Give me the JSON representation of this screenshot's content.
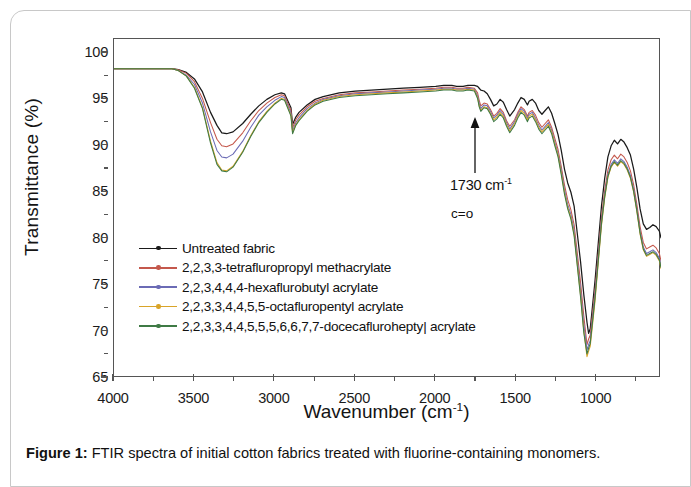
{
  "figure": {
    "caption_label": "Figure 1:",
    "caption_text": " FTIR spectra of initial cotton fabrics treated with fluorine-containing monomers."
  },
  "annotation": {
    "wavenumber": "1730 cm",
    "wavenumber_sup": "-1",
    "assignment": "c=o"
  },
  "chart_data": {
    "type": "line",
    "title": "",
    "xlabel": "Wavenumber (cm",
    "xlabel_sup": "-1",
    "xlabel_tail": ")",
    "ylabel": "Transmittance (%)",
    "xlim": [
      4000,
      600
    ],
    "ylim": [
      65,
      101.5
    ],
    "x_reversed": true,
    "grid": false,
    "legend_position": "center-left",
    "xticks": [
      4000,
      3500,
      3000,
      2500,
      2000,
      1500,
      1000
    ],
    "xtick_labels": [
      "4000",
      "3500",
      "3000",
      "2500",
      "2000",
      "1500",
      "1000"
    ],
    "x_minor_ticks": [
      3750,
      3250,
      2750,
      2250,
      1750,
      1250,
      750
    ],
    "yticks": [
      65,
      70,
      75,
      80,
      85,
      90,
      95,
      100
    ],
    "ytick_labels": [
      "65",
      "70",
      "75",
      "80",
      "85",
      "90",
      "95",
      "100"
    ],
    "y_minor_ticks": [
      67.5,
      72.5,
      77.5,
      82.5,
      87.5,
      92.5,
      97.5
    ],
    "series": [
      {
        "name": "Untreated fabric",
        "color": "#1a1a1a",
        "marker": "dot",
        "x": [
          4000,
          3900,
          3800,
          3700,
          3640,
          3600,
          3550,
          3500,
          3450,
          3400,
          3360,
          3330,
          3300,
          3260,
          3200,
          3150,
          3100,
          3050,
          3000,
          2960,
          2940,
          2900,
          2890,
          2870,
          2850,
          2800,
          2750,
          2700,
          2600,
          2500,
          2400,
          2300,
          2200,
          2100,
          2000,
          1950,
          1900,
          1870,
          1830,
          1800,
          1760,
          1740,
          1730,
          1720,
          1700,
          1680,
          1660,
          1640,
          1620,
          1600,
          1580,
          1560,
          1540,
          1510,
          1490,
          1470,
          1450,
          1430,
          1420,
          1400,
          1380,
          1360,
          1340,
          1320,
          1300,
          1280,
          1260,
          1240,
          1220,
          1200,
          1180,
          1160,
          1140,
          1120,
          1100,
          1080,
          1060,
          1050,
          1040,
          1030,
          1010,
          990,
          970,
          950,
          930,
          910,
          890,
          870,
          850,
          830,
          810,
          790,
          770,
          750,
          730,
          710,
          690,
          670,
          650,
          630,
          610,
          600
        ],
        "y": [
          98.3,
          98.3,
          98.3,
          98.3,
          98.3,
          98.2,
          97.9,
          97.2,
          95.8,
          93.6,
          92.2,
          91.4,
          91.3,
          91.5,
          92.4,
          93.4,
          94.3,
          95.0,
          95.5,
          95.7,
          95.6,
          94.1,
          92.3,
          93.1,
          93.6,
          94.4,
          95.0,
          95.3,
          95.7,
          95.9,
          96.0,
          96.1,
          96.2,
          96.3,
          96.4,
          96.5,
          96.5,
          96.4,
          96.4,
          96.5,
          96.5,
          96.4,
          96.2,
          96.0,
          95.9,
          95.6,
          95.0,
          94.3,
          94.5,
          95.0,
          94.7,
          93.9,
          93.2,
          93.9,
          94.6,
          95.2,
          95.0,
          94.4,
          94.8,
          95.0,
          94.6,
          93.8,
          93.4,
          93.8,
          94.2,
          93.5,
          92.4,
          91.2,
          89.5,
          87.5,
          86.0,
          85.0,
          83.5,
          80.5,
          77.5,
          74.0,
          71.0,
          69.8,
          70.3,
          72.0,
          75.5,
          79.5,
          83.5,
          86.5,
          88.8,
          90.0,
          90.6,
          90.2,
          90.7,
          90.4,
          89.8,
          89.0,
          87.5,
          85.5,
          83.2,
          81.6,
          81.0,
          81.2,
          81.5,
          81.3,
          80.8,
          80.1
        ],
        "linewidth": 1.25
      },
      {
        "name": "2,2,3,3-tetrafluropropyl methacrylate",
        "color": "#c4584c",
        "marker": "dot",
        "x": [
          4000,
          3900,
          3800,
          3700,
          3640,
          3600,
          3550,
          3500,
          3450,
          3400,
          3360,
          3330,
          3300,
          3260,
          3200,
          3150,
          3100,
          3050,
          3000,
          2960,
          2940,
          2900,
          2890,
          2870,
          2850,
          2800,
          2750,
          2700,
          2600,
          2500,
          2400,
          2300,
          2200,
          2100,
          2000,
          1950,
          1900,
          1870,
          1830,
          1800,
          1760,
          1740,
          1730,
          1720,
          1700,
          1680,
          1660,
          1640,
          1620,
          1600,
          1580,
          1560,
          1540,
          1510,
          1490,
          1470,
          1450,
          1430,
          1420,
          1400,
          1380,
          1360,
          1340,
          1320,
          1300,
          1280,
          1260,
          1240,
          1220,
          1200,
          1180,
          1160,
          1140,
          1120,
          1100,
          1080,
          1060,
          1050,
          1040,
          1030,
          1010,
          990,
          970,
          950,
          930,
          910,
          890,
          870,
          850,
          830,
          810,
          790,
          770,
          750,
          730,
          710,
          690,
          670,
          650,
          630,
          610,
          600
        ],
        "y": [
          98.3,
          98.3,
          98.3,
          98.3,
          98.3,
          98.2,
          97.8,
          96.9,
          95.1,
          92.5,
          90.7,
          90.0,
          89.9,
          90.2,
          91.4,
          92.7,
          93.8,
          94.6,
          95.2,
          95.5,
          95.4,
          93.8,
          91.9,
          92.8,
          93.3,
          94.2,
          94.8,
          95.1,
          95.5,
          95.7,
          95.8,
          95.9,
          96.0,
          96.1,
          96.2,
          96.3,
          96.3,
          96.2,
          96.2,
          96.3,
          96.2,
          95.7,
          94.9,
          94.3,
          94.6,
          94.5,
          93.9,
          93.2,
          93.5,
          94.0,
          93.6,
          92.7,
          92.1,
          92.8,
          93.6,
          94.2,
          93.9,
          93.2,
          93.6,
          93.8,
          93.3,
          92.5,
          92.0,
          92.4,
          92.8,
          92.0,
          90.8,
          89.6,
          87.8,
          85.8,
          84.2,
          83.1,
          81.5,
          78.4,
          75.3,
          71.7,
          68.6,
          69.2,
          69.6,
          71.2,
          74.5,
          78.4,
          82.3,
          85.2,
          87.4,
          88.5,
          89.0,
          88.6,
          89.1,
          88.8,
          88.2,
          87.3,
          85.8,
          83.7,
          81.3,
          79.6,
          78.9,
          79.1,
          79.3,
          79.0,
          78.4,
          77.6
        ],
        "linewidth": 1.05
      },
      {
        "name": "2,2,3,4,4,4-hexaflurobutyl acrylate",
        "color": "#6b6bb5",
        "marker": "dot",
        "x": [
          4000,
          3900,
          3800,
          3700,
          3640,
          3600,
          3550,
          3500,
          3450,
          3400,
          3360,
          3330,
          3300,
          3260,
          3200,
          3150,
          3100,
          3050,
          3000,
          2960,
          2940,
          2900,
          2890,
          2870,
          2850,
          2800,
          2750,
          2700,
          2600,
          2500,
          2400,
          2300,
          2200,
          2100,
          2000,
          1950,
          1900,
          1870,
          1830,
          1800,
          1760,
          1740,
          1730,
          1720,
          1700,
          1680,
          1660,
          1640,
          1620,
          1600,
          1580,
          1560,
          1540,
          1510,
          1490,
          1470,
          1450,
          1430,
          1420,
          1400,
          1380,
          1360,
          1340,
          1320,
          1300,
          1280,
          1260,
          1240,
          1220,
          1200,
          1180,
          1160,
          1140,
          1120,
          1100,
          1080,
          1060,
          1050,
          1040,
          1030,
          1010,
          990,
          970,
          950,
          930,
          910,
          890,
          870,
          850,
          830,
          810,
          790,
          770,
          750,
          730,
          710,
          690,
          670,
          650,
          630,
          610,
          600
        ],
        "y": [
          98.3,
          98.3,
          98.3,
          98.3,
          98.3,
          98.1,
          97.6,
          96.6,
          94.6,
          91.5,
          89.5,
          88.8,
          88.7,
          89.1,
          90.5,
          92.0,
          93.3,
          94.2,
          94.9,
          95.3,
          95.2,
          93.5,
          91.6,
          92.5,
          93.0,
          94.0,
          94.6,
          95.0,
          95.4,
          95.6,
          95.7,
          95.8,
          95.9,
          96.0,
          96.1,
          96.2,
          96.2,
          96.1,
          96.1,
          96.2,
          96.1,
          95.4,
          94.6,
          94.0,
          94.4,
          94.3,
          93.7,
          93.0,
          93.3,
          93.8,
          93.4,
          92.5,
          91.8,
          92.6,
          93.4,
          94.0,
          93.7,
          93.0,
          93.4,
          93.6,
          93.0,
          92.2,
          91.7,
          92.1,
          92.5,
          91.7,
          90.4,
          89.2,
          87.4,
          85.3,
          83.7,
          82.6,
          80.9,
          77.7,
          74.5,
          70.8,
          68.0,
          68.6,
          69.0,
          70.6,
          73.9,
          77.9,
          81.8,
          84.7,
          86.9,
          88.0,
          88.5,
          88.1,
          88.6,
          88.3,
          87.7,
          86.8,
          85.3,
          83.2,
          80.8,
          79.1,
          78.4,
          78.6,
          78.8,
          78.5,
          77.9,
          77.1
        ],
        "linewidth": 1.05
      },
      {
        "name": "2,2,3,3,4,4,5,5-octafluropentyl acrylate",
        "color": "#d9a428",
        "marker": "dot",
        "x": [
          4000,
          3900,
          3800,
          3700,
          3640,
          3600,
          3550,
          3500,
          3450,
          3400,
          3360,
          3330,
          3300,
          3260,
          3200,
          3150,
          3100,
          3050,
          3000,
          2960,
          2940,
          2900,
          2890,
          2870,
          2850,
          2800,
          2750,
          2700,
          2600,
          2500,
          2400,
          2300,
          2200,
          2100,
          2000,
          1950,
          1900,
          1870,
          1830,
          1800,
          1760,
          1740,
          1730,
          1720,
          1700,
          1680,
          1660,
          1640,
          1620,
          1600,
          1580,
          1560,
          1540,
          1510,
          1490,
          1470,
          1450,
          1430,
          1420,
          1400,
          1380,
          1360,
          1340,
          1320,
          1300,
          1280,
          1260,
          1240,
          1220,
          1200,
          1180,
          1160,
          1140,
          1120,
          1100,
          1080,
          1060,
          1050,
          1040,
          1030,
          1010,
          990,
          970,
          950,
          930,
          910,
          890,
          870,
          850,
          830,
          810,
          790,
          770,
          750,
          730,
          710,
          690,
          670,
          650,
          630,
          610,
          600
        ],
        "y": [
          98.3,
          98.3,
          98.3,
          98.3,
          98.3,
          98.1,
          97.5,
          96.3,
          94.1,
          90.5,
          88.2,
          87.4,
          87.3,
          87.8,
          89.4,
          91.1,
          92.6,
          93.7,
          94.6,
          95.1,
          95.0,
          93.3,
          91.4,
          92.3,
          92.8,
          93.8,
          94.5,
          94.9,
          95.3,
          95.5,
          95.6,
          95.7,
          95.8,
          95.9,
          96.0,
          96.1,
          96.1,
          96.0,
          96.0,
          96.1,
          96.0,
          95.2,
          94.3,
          93.8,
          94.2,
          94.1,
          93.5,
          92.8,
          93.1,
          93.6,
          93.2,
          92.3,
          91.6,
          92.4,
          93.2,
          93.8,
          93.5,
          92.8,
          93.2,
          93.4,
          92.8,
          92.0,
          91.5,
          91.9,
          92.3,
          91.5,
          90.2,
          89.0,
          87.1,
          85.0,
          83.4,
          82.3,
          80.5,
          77.2,
          73.9,
          70.1,
          67.3,
          67.9,
          68.4,
          70.0,
          73.3,
          77.4,
          81.4,
          84.4,
          86.6,
          87.7,
          88.2,
          87.8,
          88.3,
          88.0,
          87.4,
          86.5,
          85.0,
          82.9,
          80.5,
          78.8,
          78.1,
          78.3,
          78.5,
          78.2,
          77.6,
          76.8
        ],
        "linewidth": 1.05
      },
      {
        "name": "2,2,3,3,4,4,5,5,5,6,6,7,7-docecaflurohepty| acrylate",
        "color": "#3f7a45",
        "marker": "dot",
        "x": [
          4000,
          3900,
          3800,
          3700,
          3640,
          3600,
          3550,
          3500,
          3450,
          3400,
          3360,
          3330,
          3300,
          3260,
          3200,
          3150,
          3100,
          3050,
          3000,
          2960,
          2940,
          2900,
          2890,
          2870,
          2850,
          2800,
          2750,
          2700,
          2600,
          2500,
          2400,
          2300,
          2200,
          2100,
          2000,
          1950,
          1900,
          1870,
          1830,
          1800,
          1760,
          1740,
          1730,
          1720,
          1700,
          1680,
          1660,
          1640,
          1620,
          1600,
          1580,
          1560,
          1540,
          1510,
          1490,
          1470,
          1450,
          1430,
          1420,
          1400,
          1380,
          1360,
          1340,
          1320,
          1300,
          1280,
          1260,
          1240,
          1220,
          1200,
          1180,
          1160,
          1140,
          1120,
          1100,
          1080,
          1060,
          1050,
          1040,
          1030,
          1010,
          990,
          970,
          950,
          930,
          910,
          890,
          870,
          850,
          830,
          810,
          790,
          770,
          750,
          730,
          710,
          690,
          670,
          650,
          630,
          610,
          600
        ],
        "y": [
          98.3,
          98.3,
          98.3,
          98.3,
          98.3,
          98.1,
          97.5,
          96.2,
          94.0,
          90.3,
          88.0,
          87.3,
          87.2,
          87.7,
          89.3,
          91.0,
          92.5,
          93.6,
          94.5,
          95.0,
          94.9,
          93.2,
          91.3,
          92.2,
          92.7,
          93.7,
          94.4,
          94.8,
          95.2,
          95.4,
          95.5,
          95.6,
          95.7,
          95.8,
          95.9,
          96.0,
          96.0,
          95.9,
          95.9,
          96.0,
          95.9,
          95.1,
          94.2,
          93.7,
          94.1,
          94.0,
          93.4,
          92.6,
          92.9,
          93.4,
          93.0,
          92.1,
          91.4,
          92.2,
          93.0,
          93.6,
          93.3,
          92.6,
          93.0,
          93.2,
          92.6,
          91.8,
          91.3,
          91.7,
          92.1,
          91.3,
          90.0,
          88.8,
          86.9,
          84.8,
          83.2,
          82.1,
          80.3,
          77.0,
          73.7,
          69.9,
          67.6,
          68.2,
          68.7,
          70.3,
          73.6,
          77.6,
          81.6,
          84.5,
          86.7,
          87.8,
          88.3,
          87.9,
          88.4,
          88.1,
          87.5,
          86.6,
          85.1,
          83.0,
          80.6,
          78.9,
          78.2,
          78.4,
          78.6,
          78.3,
          77.7,
          76.9
        ],
        "linewidth": 1.05
      }
    ]
  }
}
